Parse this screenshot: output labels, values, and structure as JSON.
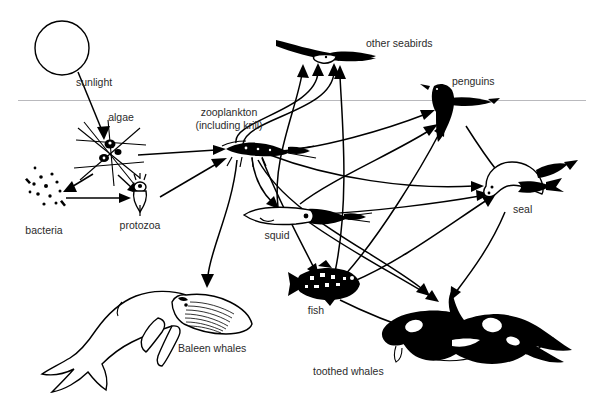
{
  "diagram": {
    "background_color": "#ffffff",
    "ink_color": "#000000",
    "label_color": "#2b2b2b",
    "waterline_color": "#b9b9bd",
    "nodes": [
      {
        "id": "sun",
        "label": "",
        "icon": "sun-circle-icon",
        "x": 62,
        "y": 48
      },
      {
        "id": "sunlight",
        "label": "sunlight",
        "icon": "sunlight-label",
        "x": 101,
        "y": 82
      },
      {
        "id": "algae",
        "label": "algae",
        "icon": "algae-diatom-icon",
        "x": 110,
        "y": 150
      },
      {
        "id": "bacteria",
        "label": "bacteria",
        "icon": "bacteria-dots-icon",
        "x": 50,
        "y": 192
      },
      {
        "id": "protozoa",
        "label": "protozoa",
        "icon": "protozoa-ciliate-icon",
        "x": 139,
        "y": 203
      },
      {
        "id": "zooplankton",
        "label": "zooplankton",
        "label2": "(including krill)",
        "icon": "krill-icon",
        "x": 250,
        "y": 147
      },
      {
        "id": "squid",
        "label": "squid",
        "icon": "squid-icon",
        "x": 288,
        "y": 216
      },
      {
        "id": "fish",
        "label": "fish",
        "icon": "fish-icon",
        "x": 325,
        "y": 285
      },
      {
        "id": "seabirds",
        "label": "other seabirds",
        "icon": "seabird-icon",
        "x": 330,
        "y": 48
      },
      {
        "id": "penguins",
        "label": "penguins",
        "icon": "penguin-icon",
        "x": 452,
        "y": 104
      },
      {
        "id": "seal",
        "label": "seal",
        "icon": "seal-icon",
        "x": 512,
        "y": 190
      },
      {
        "id": "baleen",
        "label": "Baleen whales",
        "icon": "baleen-whale-icon",
        "x": 130,
        "y": 320
      },
      {
        "id": "toothed",
        "label": "toothed whales",
        "icon": "orca-icon",
        "x": 460,
        "y": 330
      }
    ],
    "labels": {
      "sunlight": "sunlight",
      "algae": "algae",
      "bacteria": "bacteria",
      "protozoa": "protozoa",
      "zooplankton_line1": "zooplankton",
      "zooplankton_line2": "(including krill)",
      "squid": "squid",
      "fish": "fish",
      "seabirds": "other seabirds",
      "penguins": "penguins",
      "seal": "seal",
      "baleen_whales": "Baleen whales",
      "toothed_whales": "toothed whales"
    },
    "edges": [
      {
        "from": "sun",
        "to": "algae"
      },
      {
        "from": "algae",
        "to": "bacteria"
      },
      {
        "from": "algae",
        "to": "protozoa"
      },
      {
        "from": "bacteria",
        "to": "protozoa"
      },
      {
        "from": "algae",
        "to": "zooplankton"
      },
      {
        "from": "protozoa",
        "to": "zooplankton"
      },
      {
        "from": "zooplankton",
        "to": "seabirds"
      },
      {
        "from": "zooplankton",
        "to": "penguins"
      },
      {
        "from": "zooplankton",
        "to": "seal"
      },
      {
        "from": "zooplankton",
        "to": "squid"
      },
      {
        "from": "zooplankton",
        "to": "fish"
      },
      {
        "from": "zooplankton",
        "to": "baleen"
      },
      {
        "from": "zooplankton",
        "to": "toothed"
      },
      {
        "from": "squid",
        "to": "seabirds"
      },
      {
        "from": "squid",
        "to": "penguins"
      },
      {
        "from": "squid",
        "to": "seal"
      },
      {
        "from": "squid",
        "to": "toothed"
      },
      {
        "from": "fish",
        "to": "seabirds"
      },
      {
        "from": "fish",
        "to": "penguins"
      },
      {
        "from": "fish",
        "to": "seal"
      },
      {
        "from": "fish",
        "to": "toothed"
      },
      {
        "from": "penguins",
        "to": "seal"
      },
      {
        "from": "seal",
        "to": "toothed"
      }
    ]
  }
}
